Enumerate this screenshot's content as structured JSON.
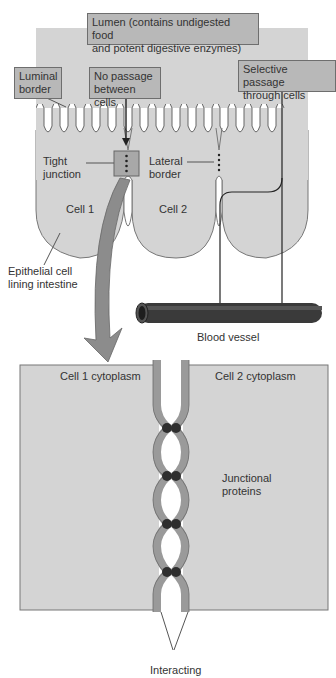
{
  "labels": {
    "lumen": "Lumen (contains undigested food and potent digestive enzymes)",
    "lumen_line1": "Lumen (contains undigested food",
    "lumen_line2": "and potent digestive enzymes)",
    "luminal_border_1": "Luminal",
    "luminal_border_2": "border",
    "no_passage_1": "No passage",
    "no_passage_2": "between cells",
    "selective_1": "Selective passage",
    "selective_2": "through cells",
    "tight_junction_1": "Tight",
    "tight_junction_2": "junction",
    "lateral_border_1": "Lateral",
    "lateral_border_2": "border",
    "cell1": "Cell 1",
    "cell2": "Cell 2",
    "epithelial_1": "Epithelial cell",
    "epithelial_2": "lining intestine",
    "blood_vessel": "Blood  vessel",
    "cell1_cytoplasm": "Cell 1 cytoplasm",
    "cell2_cytoplasm": "Cell 2 cytoplasm",
    "junctional_1": "Junctional",
    "junctional_2": "proteins",
    "interacting": "Interacting"
  },
  "colors": {
    "cell_fill": "#d4d4d4",
    "label_box": "#b8b8b8",
    "membrane": "#9a9a9a",
    "protein": "#2e2e2e",
    "vessel": "#3a3a3a",
    "arrow": "#8c8c8c"
  }
}
